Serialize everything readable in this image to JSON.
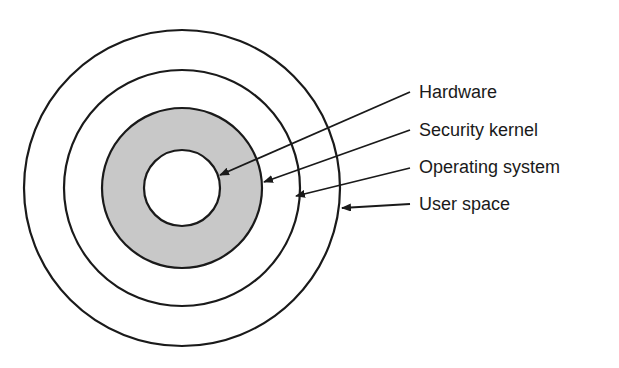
{
  "diagram": {
    "type": "concentric-rings",
    "layers": [
      {
        "name": "Hardware",
        "fill": "#ffffff"
      },
      {
        "name": "Security kernel",
        "fill": "#c8c8c8"
      },
      {
        "name": "Operating system",
        "fill": "#ffffff"
      },
      {
        "name": "User space",
        "fill": "#ffffff"
      }
    ],
    "labels": [
      "Hardware",
      "Security kernel",
      "Operating system",
      "User space"
    ],
    "colors": {
      "stroke": "#1a1a1a",
      "shade": "#c8c8c8",
      "background": "#ffffff"
    }
  }
}
